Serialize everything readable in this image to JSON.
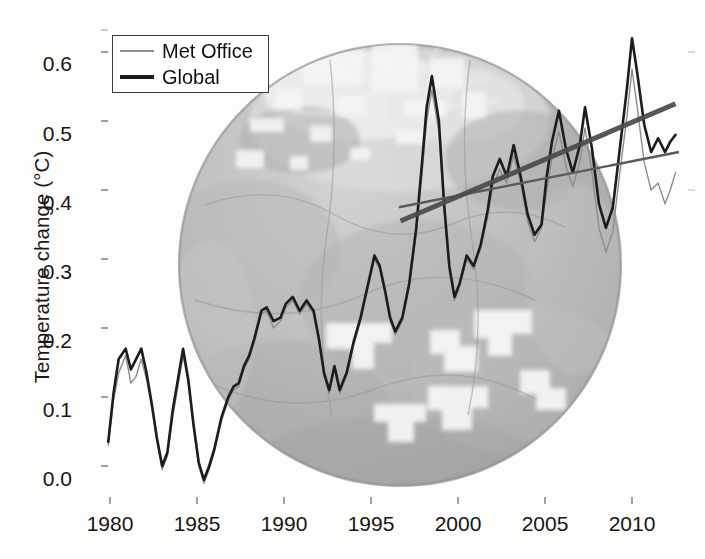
{
  "figure": {
    "ylabel": "Temperature change (°C)",
    "xlabel": "",
    "background_image": "earth-globe-satellite"
  },
  "legend": {
    "position": "top-left",
    "entries": [
      {
        "label": "Met Office",
        "style": "thin-gray-line",
        "color": "#8d8d8d"
      },
      {
        "label": "Global",
        "style": "thick-black-line",
        "color": "#1c1c1c"
      }
    ]
  },
  "axes": {
    "y_ticks": [
      "0.6",
      "0.5",
      "0.4",
      "0.3",
      "0.2",
      "0.1",
      "0.0"
    ],
    "x_ticks": [
      "1980",
      "1985",
      "1990",
      "1995",
      "2000",
      "2005",
      "2010"
    ]
  },
  "chart_data": {
    "type": "line",
    "title": "",
    "xlabel": "",
    "ylabel": "Temperature change (°C)",
    "xlim": [
      1979.5,
      2012.6
    ],
    "ylim": [
      -0.04,
      0.66
    ],
    "grid": false,
    "legend_position": "upper left",
    "xticks": [
      1980,
      1985,
      1990,
      1995,
      2000,
      2005,
      2010
    ],
    "yticks": [
      0.0,
      0.1,
      0.2,
      0.3,
      0.4,
      0.5,
      0.6
    ],
    "x": [
      1979.9,
      1980.2,
      1980.5,
      1980.9,
      1981.2,
      1981.5,
      1981.8,
      1982.1,
      1982.4,
      1982.7,
      1983.0,
      1983.3,
      1983.6,
      1983.9,
      1984.2,
      1984.5,
      1984.8,
      1985.1,
      1985.4,
      1985.7,
      1986.0,
      1986.4,
      1986.8,
      1987.1,
      1987.4,
      1987.7,
      1988.0,
      1988.3,
      1988.7,
      1989.0,
      1989.4,
      1989.8,
      1990.1,
      1990.5,
      1990.9,
      1991.3,
      1991.7,
      1992.0,
      1992.3,
      1992.6,
      1992.9,
      1993.2,
      1993.6,
      1994.0,
      1994.4,
      1994.8,
      1995.2,
      1995.5,
      1995.8,
      1996.1,
      1996.4,
      1996.8,
      1997.2,
      1997.6,
      1997.9,
      1998.2,
      1998.5,
      1998.9,
      1999.2,
      1999.5,
      1999.8,
      2000.1,
      2000.5,
      2000.9,
      2001.3,
      2001.7,
      2002.0,
      2002.4,
      2002.8,
      2003.2,
      2003.6,
      2004.0,
      2004.4,
      2004.8,
      2005.1,
      2005.4,
      2005.8,
      2006.2,
      2006.6,
      2007.0,
      2007.3,
      2007.7,
      2008.1,
      2008.5,
      2008.9,
      2009.3,
      2009.7,
      2010.0,
      2010.3,
      2010.7,
      2011.1,
      2011.5,
      2011.9,
      2012.2,
      2012.5
    ],
    "series": [
      {
        "name": "Global",
        "color": "#1c1c1c",
        "linewidth": 2.6,
        "values": [
          0.035,
          0.105,
          0.155,
          0.17,
          0.14,
          0.155,
          0.17,
          0.135,
          0.09,
          0.04,
          0.0,
          0.02,
          0.08,
          0.125,
          0.17,
          0.125,
          0.06,
          0.005,
          -0.02,
          0.0,
          0.025,
          0.07,
          0.1,
          0.115,
          0.12,
          0.145,
          0.16,
          0.185,
          0.225,
          0.23,
          0.21,
          0.215,
          0.235,
          0.245,
          0.225,
          0.24,
          0.225,
          0.185,
          0.135,
          0.11,
          0.145,
          0.11,
          0.135,
          0.18,
          0.215,
          0.26,
          0.305,
          0.29,
          0.255,
          0.215,
          0.195,
          0.215,
          0.265,
          0.345,
          0.43,
          0.52,
          0.565,
          0.5,
          0.38,
          0.29,
          0.245,
          0.265,
          0.305,
          0.29,
          0.32,
          0.37,
          0.42,
          0.445,
          0.42,
          0.465,
          0.42,
          0.365,
          0.335,
          0.35,
          0.42,
          0.47,
          0.515,
          0.46,
          0.425,
          0.465,
          0.52,
          0.46,
          0.38,
          0.345,
          0.375,
          0.46,
          0.545,
          0.62,
          0.57,
          0.495,
          0.455,
          0.475,
          0.455,
          0.47,
          0.48
        ]
      },
      {
        "name": "Met Office",
        "color": "#8d8d8d",
        "linewidth": 1.4,
        "values": [
          0.03,
          0.095,
          0.135,
          0.16,
          0.12,
          0.13,
          0.155,
          0.125,
          0.085,
          0.035,
          -0.005,
          0.015,
          0.07,
          0.115,
          0.16,
          0.12,
          0.055,
          0.0,
          -0.025,
          -0.005,
          0.02,
          0.065,
          0.095,
          0.11,
          0.115,
          0.14,
          0.155,
          0.18,
          0.22,
          0.225,
          0.2,
          0.21,
          0.23,
          0.24,
          0.22,
          0.235,
          0.22,
          0.18,
          0.13,
          0.105,
          0.14,
          0.105,
          0.13,
          0.175,
          0.21,
          0.255,
          0.3,
          0.285,
          0.25,
          0.21,
          0.19,
          0.21,
          0.26,
          0.335,
          0.415,
          0.5,
          0.545,
          0.485,
          0.37,
          0.28,
          0.24,
          0.26,
          0.3,
          0.285,
          0.315,
          0.36,
          0.405,
          0.43,
          0.41,
          0.45,
          0.41,
          0.355,
          0.325,
          0.345,
          0.4,
          0.445,
          0.485,
          0.435,
          0.405,
          0.44,
          0.49,
          0.425,
          0.345,
          0.31,
          0.34,
          0.425,
          0.505,
          0.575,
          0.52,
          0.44,
          0.4,
          0.41,
          0.38,
          0.4,
          0.425
        ]
      }
    ],
    "trend_lines": [
      {
        "name": "steep-trend",
        "x": [
          1996.7,
          2012.5
        ],
        "y": [
          0.355,
          0.525
        ],
        "color": "#4a4a4a",
        "linewidth": 5
      },
      {
        "name": "shallow-trend",
        "x": [
          1996.6,
          2012.7
        ],
        "y": [
          0.375,
          0.455
        ],
        "color": "#5a5a5a",
        "linewidth": 2.4
      }
    ]
  }
}
